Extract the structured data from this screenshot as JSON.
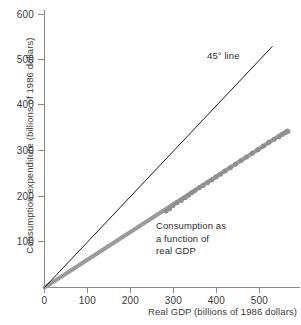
{
  "chart_data": {
    "type": "scatter",
    "title": "",
    "xlabel": "Real GDP (billions of 1986 dollars)",
    "ylabel": "Consumption expenditure (billions of 1986 dollars)",
    "xlim": [
      0,
      600
    ],
    "ylim": [
      0,
      620
    ],
    "grid": false,
    "legend": "none",
    "xticks": [
      0,
      100,
      200,
      300,
      400,
      500
    ],
    "xticklabels": [
      "0",
      "100",
      "200",
      "300",
      "400",
      "500"
    ],
    "yticks": [
      100,
      200,
      300,
      400,
      500,
      600
    ],
    "yticklabels": [
      "100",
      "200",
      "300",
      "400",
      "500",
      "600"
    ],
    "series": [
      {
        "name": "45 degree line",
        "type": "line",
        "color": "#1a1a1a",
        "width": 1,
        "x": [
          0,
          530
        ],
        "y": [
          0,
          530
        ]
      },
      {
        "name": "Consumption as a function of real GDP",
        "type": "line",
        "color": "#9b9b9b",
        "width": 4,
        "x": [
          0,
          565
        ],
        "y": [
          0,
          345
        ]
      },
      {
        "name": "Consumption data points",
        "type": "scatter",
        "color": "#8f8f8f",
        "marker_size": 5,
        "points": [
          [
            283,
            168
          ],
          [
            291,
            173
          ],
          [
            299,
            180
          ],
          [
            308,
            186
          ],
          [
            318,
            191
          ],
          [
            327,
            197
          ],
          [
            335,
            203
          ],
          [
            343,
            209
          ],
          [
            350,
            213
          ],
          [
            360,
            219
          ],
          [
            369,
            224
          ],
          [
            379,
            230
          ],
          [
            389,
            236
          ],
          [
            399,
            243
          ],
          [
            409,
            249
          ],
          [
            420,
            256
          ],
          [
            432,
            263
          ],
          [
            444,
            271
          ],
          [
            457,
            279
          ],
          [
            470,
            287
          ],
          [
            483,
            295
          ],
          [
            496,
            303
          ],
          [
            509,
            311
          ],
          [
            522,
            319
          ],
          [
            534,
            326
          ],
          [
            545,
            331
          ],
          [
            553,
            336
          ],
          [
            560,
            340
          ],
          [
            566,
            343
          ]
        ]
      }
    ],
    "annotations": [
      {
        "name": "forty-five-degree-line-label",
        "text": "45° line",
        "x": 400,
        "y": 545
      },
      {
        "name": "consumption-function-label",
        "lines": [
          "Consumption as",
          "a function of",
          "real GDP"
        ],
        "x": 265,
        "y": 155
      }
    ]
  },
  "axes": {
    "y_title": "Consumption expenditure (billions of 1986 dollars)",
    "x_title": "Real GDP (billions of 1986 dollars)",
    "y_ticks": [
      "600",
      "500",
      "400",
      "300",
      "200",
      "100"
    ],
    "x_ticks": [
      "0",
      "100",
      "200",
      "300",
      "400",
      "500"
    ]
  },
  "annotations": {
    "forty_five": "45° line",
    "consumption_line_1": "Consumption as",
    "consumption_line_2": "a function of",
    "consumption_line_3": "real GDP"
  },
  "colors": {
    "axis": "#8a8a8a",
    "text": "#3a3a3a",
    "reference_line": "#1a1a1a",
    "consumption_line": "#9b9b9b",
    "data_points": "#8f8f8f",
    "background": "#ffffff"
  }
}
